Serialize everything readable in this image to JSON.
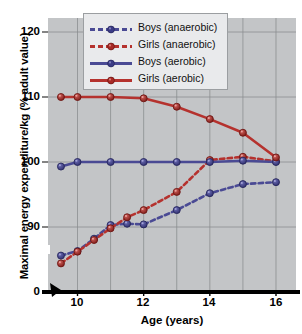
{
  "chart_data": {
    "type": "line",
    "title": "",
    "xlabel": "Age (years)",
    "ylabel": "Maximal energy expenditure/kg (% adult value)",
    "xlim": [
      9.4,
      16.6
    ],
    "ylim": [
      84,
      123.5
    ],
    "y_axis_break": true,
    "y_break_below": 90,
    "zero_tick_label": "0",
    "grid": true,
    "legend_position": "top-center",
    "xticks": [
      10,
      12,
      14,
      16
    ],
    "xtick_labels": [
      "10",
      "12",
      "14",
      "16"
    ],
    "x_gridlines": [
      10,
      11,
      12,
      13,
      14,
      15,
      16
    ],
    "yticks": [
      90,
      100,
      110,
      120
    ],
    "ytick_labels": [
      "90",
      "100",
      "110",
      "120"
    ],
    "colors": {
      "boys": "#4a4a94",
      "girls": "#b5322e",
      "plot_background": "#c3c5c7",
      "gridline": "#8a8d90",
      "axis": "#000000",
      "legend_background": "#e9eaec"
    },
    "series": [
      {
        "name": "Boys (anaerobic)",
        "color": "#4a4a94",
        "style": "dashed",
        "x": [
          9.5,
          10,
          10.5,
          11,
          11.5,
          12,
          13,
          14,
          15,
          16
        ],
        "values": [
          85.6,
          86.3,
          88.2,
          90.3,
          90.5,
          90.4,
          92.6,
          95.2,
          96.6,
          96.9
        ]
      },
      {
        "name": "Girls (anaerobic)",
        "color": "#b5322e",
        "style": "dashed",
        "x": [
          9.5,
          10,
          10.5,
          11,
          11.5,
          12,
          13,
          14,
          15,
          16
        ],
        "values": [
          84.4,
          86.2,
          88.0,
          89.8,
          91.5,
          92.6,
          95.4,
          100.3,
          100.8,
          100.1
        ]
      },
      {
        "name": "Boys (aerobic)",
        "color": "#4a4a94",
        "style": "solid",
        "x": [
          9.5,
          10,
          11,
          12,
          13,
          14,
          15,
          16
        ],
        "values": [
          99.3,
          100,
          100,
          100,
          100,
          100,
          100.2,
          100
        ]
      },
      {
        "name": "Girls (aerobic)",
        "color": "#b5322e",
        "style": "solid",
        "x": [
          9.5,
          10,
          11,
          12,
          13,
          14,
          15,
          16
        ],
        "values": [
          110,
          110,
          110,
          109.8,
          108.5,
          106.6,
          104.5,
          100.7
        ]
      }
    ]
  },
  "legend": {
    "items": [
      {
        "label": "Boys (anaerobic)"
      },
      {
        "label": "Girls (anaerobic)"
      },
      {
        "label": "Boys (aerobic)"
      },
      {
        "label": "Girls (aerobic)"
      }
    ]
  },
  "axes": {
    "x_title": "Age (years)",
    "y_title": "Maximal energy expenditure/kg (% adult value)",
    "y_zero": "0"
  }
}
